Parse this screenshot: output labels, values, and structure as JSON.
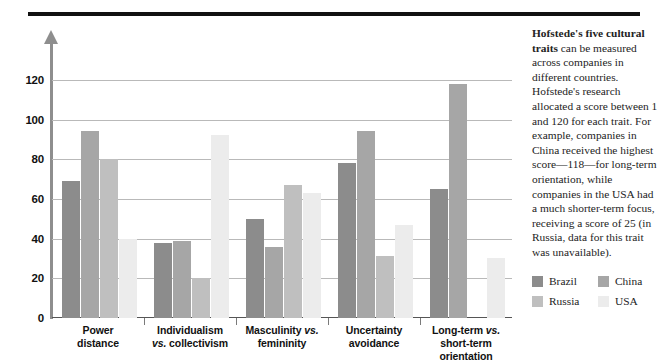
{
  "chart_data": {
    "type": "bar",
    "title": "",
    "xlabel": "",
    "ylabel": "",
    "ylim": [
      0,
      130
    ],
    "yticks": [
      0,
      20,
      40,
      60,
      80,
      100,
      120
    ],
    "grid": true,
    "legend_position": "right-bottom",
    "categories": [
      "Power distance",
      "Individualism vs. collectivism",
      "Masculinity vs. femininity",
      "Uncertainty avoidance",
      "Long-term vs. short-term orientation"
    ],
    "category_lines": [
      [
        "Power",
        "distance"
      ],
      [
        "Individualism",
        "vs. collectivism"
      ],
      [
        "Masculinity vs.",
        "femininity"
      ],
      [
        "Uncertainty",
        "avoidance"
      ],
      [
        "Long-term vs.",
        "short-term",
        "orientation"
      ]
    ],
    "series": [
      {
        "name": "Brazil",
        "color": "#8c8c8c",
        "values": [
          69,
          38,
          50,
          78,
          65
        ]
      },
      {
        "name": "China",
        "color": "#a6a6a6",
        "values": [
          94,
          39,
          36,
          94,
          118
        ]
      },
      {
        "name": "Russia",
        "color": "#bfbfbf",
        "values": [
          80,
          20,
          67,
          31,
          null
        ]
      },
      {
        "name": "USA",
        "color": "#ececec",
        "values": [
          40,
          92,
          63,
          47,
          30
        ]
      }
    ]
  },
  "legend": {
    "items": [
      {
        "label": "Brazil",
        "color": "#8c8c8c"
      },
      {
        "label": "China",
        "color": "#a6a6a6"
      },
      {
        "label": "Russia",
        "color": "#bfbfbf"
      },
      {
        "label": "USA",
        "color": "#ececec"
      }
    ]
  },
  "sidebar": {
    "lead": "Hofstede's five cultural traits",
    "body": " can be measured across companies in different countries. Hofstede's research allocated a score between 1 and 120 for each trait. For example, companies in China received the highest score—118—for long-term orientation, while companies in the USA had a much shorter-term focus, receiving a score of 25 (in Russia, data for this trait was unavailable)."
  }
}
